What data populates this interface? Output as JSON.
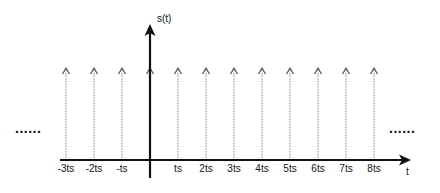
{
  "diagram": {
    "y_axis_label": "s(t)",
    "x_axis_label": "t",
    "ellipsis_left": "......",
    "ellipsis_right": "......",
    "impulses": [
      {
        "n": -3,
        "label": "-3ts"
      },
      {
        "n": -2,
        "label": "-2ts"
      },
      {
        "n": -1,
        "label": "-ts"
      },
      {
        "n": 0,
        "label": ""
      },
      {
        "n": 1,
        "label": "ts"
      },
      {
        "n": 2,
        "label": "2ts"
      },
      {
        "n": 3,
        "label": "3ts"
      },
      {
        "n": 4,
        "label": "4ts"
      },
      {
        "n": 5,
        "label": "5ts"
      },
      {
        "n": 6,
        "label": "6ts"
      },
      {
        "n": 7,
        "label": "7ts"
      },
      {
        "n": 8,
        "label": "8ts"
      }
    ],
    "colors": {
      "axis": "#111111",
      "impulse": "#888888",
      "arrowhead": "#444444"
    }
  }
}
